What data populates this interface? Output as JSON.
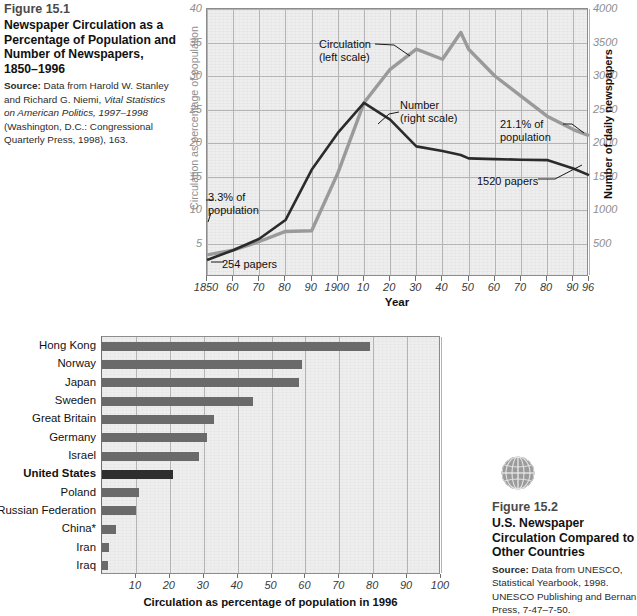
{
  "figure1": {
    "number": "Figure 15.1",
    "title": "Newspaper Circulation as a Percentage of Population and Number of Newspapers, 1850–1996",
    "source_label": "Source:",
    "source_part1": " Data from Harold W. Stanley and Richard G. Niemi, ",
    "source_italic": "Vital Statistics on American Politics, 1997–1998",
    "source_part2": " (Washington, D.C.: Congressional Quarterly Press, 1998), 163."
  },
  "figure2": {
    "number": "Figure 15.2",
    "title": "U.S. Newspaper Circulation Compared to Other Countries",
    "source_label": "Source:",
    "source_text": " Data from UNESCO, Statistical Yearbook, 1998. UNESCO Publishing and Bernan Press, 7-47–7-50.",
    "icon": "globe-icon"
  },
  "chart_data": [
    {
      "type": "line",
      "title": "Newspaper Circulation as a Percentage of Population and Number of Newspapers, 1850–1996",
      "xlabel": "Year",
      "ylabel": "Circulation as percentage of population",
      "y2label": "Number of daily newspapers",
      "x": [
        1850,
        1860,
        1870,
        1880,
        1890,
        1900,
        1910,
        1920,
        1930,
        1940,
        1947,
        1950,
        1960,
        1970,
        1980,
        1990,
        1996
      ],
      "xtick_labels": [
        "1850",
        "60",
        "70",
        "80",
        "90",
        "1900",
        "10",
        "20",
        "30",
        "40",
        "50",
        "60",
        "70",
        "80",
        "90",
        "96"
      ],
      "xtick_values": [
        1850,
        1860,
        1870,
        1880,
        1890,
        1900,
        1910,
        1920,
        1930,
        1940,
        1950,
        1960,
        1970,
        1980,
        1990,
        1996
      ],
      "xlim": [
        1850,
        1996
      ],
      "ylim": [
        0,
        40
      ],
      "ytick_labels": [
        "5",
        "10",
        "15",
        "20",
        "25",
        "30",
        "35",
        "40"
      ],
      "ytick_values": [
        5,
        10,
        15,
        20,
        25,
        30,
        35,
        40
      ],
      "y2lim": [
        0,
        4000
      ],
      "y2tick_labels": [
        "500",
        "1000",
        "1500",
        "2000",
        "2500",
        "3000",
        "3500",
        "4000"
      ],
      "y2tick_values": [
        500,
        1000,
        1500,
        2000,
        2500,
        3000,
        3500,
        4000
      ],
      "grid": true,
      "series": [
        {
          "name": "Circulation",
          "legend_label": "Circulation\n(left scale)",
          "axis": "left",
          "color": "#9a9a9a",
          "values": [
            3.3,
            4.0,
            5.3,
            6.8,
            6.9,
            15.5,
            26.0,
            31.0,
            34.0,
            32.5,
            36.5,
            34.0,
            30.0,
            27.0,
            24.0,
            22.0,
            21.1
          ]
        },
        {
          "name": "Number",
          "legend_label": "Number\n(right scale)",
          "axis": "right",
          "color": "#2b2b2b",
          "values": [
            254,
            400,
            570,
            850,
            1600,
            2150,
            2600,
            2350,
            1950,
            1880,
            1820,
            1770,
            1760,
            1750,
            1745,
            1620,
            1520
          ]
        }
      ],
      "annotations": [
        {
          "text_line1": "Circulation",
          "text_line2": "(left scale)"
        },
        {
          "text_line1": "Number",
          "text_line2": "(right scale)"
        },
        {
          "text_line1": "3.3% of",
          "text_line2": "population"
        },
        {
          "text_line1": "21.1% of",
          "text_line2": "population"
        },
        {
          "text_line1": "254 papers",
          "text_line2": ""
        },
        {
          "text_line1": "1520 papers",
          "text_line2": ""
        }
      ]
    },
    {
      "type": "bar",
      "orientation": "horizontal",
      "title": "U.S. Newspaper Circulation Compared to Other Countries",
      "xlabel": "Circulation as percentage of population in 1996",
      "ylabel": "",
      "categories": [
        "Hong Kong",
        "Norway",
        "Japan",
        "Sweden",
        "Great Britain",
        "Germany",
        "Israel",
        "United States",
        "Poland",
        "Russian Federation",
        "China*",
        "Iran",
        "Iraq"
      ],
      "values": [
        79,
        59,
        58,
        44.5,
        33,
        31,
        28.5,
        21,
        11,
        10,
        4,
        2,
        1.8
      ],
      "highlight_category": "United States",
      "bar_color": "#6a6a6a",
      "highlight_color": "#2e2e2e",
      "xlim": [
        0,
        100
      ],
      "xtick_labels": [
        "10",
        "20",
        "30",
        "40",
        "50",
        "60",
        "70",
        "80",
        "90",
        "100"
      ],
      "xtick_values": [
        10,
        20,
        30,
        40,
        50,
        60,
        70,
        80,
        90,
        100
      ],
      "grid": true
    }
  ]
}
